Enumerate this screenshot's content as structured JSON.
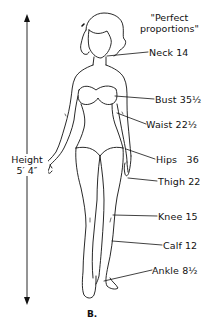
{
  "title": {
    "line1": "\"Perfect",
    "line2": "proportions\""
  },
  "height": {
    "label": "Height",
    "value": "5′ 4″"
  },
  "measurements": [
    {
      "name": "Neck",
      "value": "14",
      "text": "Neck 14"
    },
    {
      "name": "Bust",
      "value": "35½",
      "text": "Bust 35½"
    },
    {
      "name": "Waist",
      "value": "22½",
      "text": "Waist 22½"
    },
    {
      "name": "Hips",
      "value": "36",
      "text": "Hips   36"
    },
    {
      "name": "Thigh",
      "value": "22",
      "text": "Thigh 22"
    },
    {
      "name": "Knee",
      "value": "15",
      "text": "Knee 15"
    },
    {
      "name": "Calf",
      "value": "12",
      "text": "Calf 12"
    },
    {
      "name": "Ankle",
      "value": "8½",
      "text": "Ankle 8½"
    }
  ],
  "caption": "B.",
  "colors": {
    "ink": "#111111",
    "background": "#ffffff"
  }
}
